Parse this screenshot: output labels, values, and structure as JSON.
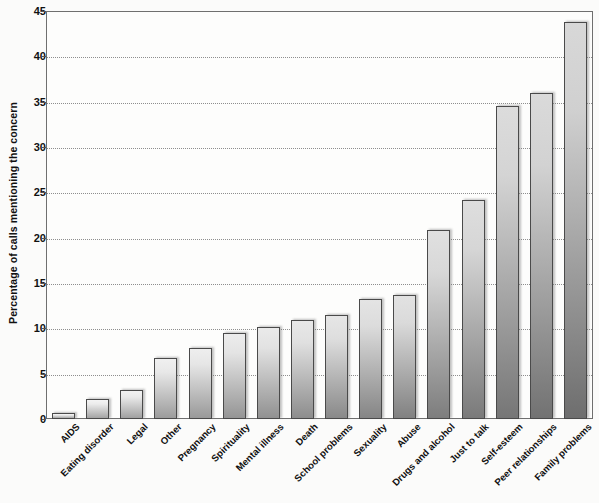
{
  "chart_data": {
    "type": "bar",
    "title": "",
    "xlabel": "",
    "ylabel": "Percentage of calls mentioning the concern",
    "ylim": [
      0,
      45
    ],
    "ytick_step": 5,
    "yticks": [
      "0",
      "5",
      "10",
      "15",
      "20",
      "25",
      "30",
      "35",
      "40",
      "45"
    ],
    "grid": true,
    "legend": "none",
    "categories": [
      "AIDS",
      "Eating disorder",
      "Legal",
      "Other",
      "Pregnancy",
      "Spirituality",
      "Mental illness",
      "Death",
      "School problems",
      "Sexuality",
      "Abuse",
      "Drugs and alcohol",
      "Just to talk",
      "Self-esteem",
      "Peer relationships",
      "Family problems"
    ],
    "values": [
      0.7,
      2.2,
      3.2,
      6.7,
      7.8,
      9.5,
      10.2,
      10.9,
      11.5,
      13.2,
      13.7,
      20.8,
      24.2,
      34.5,
      36.0,
      43.8
    ]
  },
  "style": {
    "bar_fill_light": "#f2f2f2",
    "bar_fill_dark": "#8d8d8d",
    "bar_border": "#4a4a4a",
    "axis_color": "#6f6f6f",
    "grid_color": "#8e8e8e",
    "text_color": "#111111",
    "background": "#fbfbfa"
  }
}
